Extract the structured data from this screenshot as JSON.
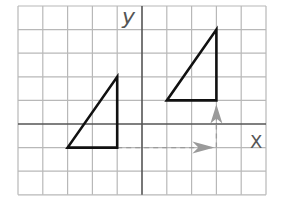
{
  "diagram": {
    "type": "coordinate-grid-translation",
    "grid": {
      "x_min": -5,
      "x_max": 5,
      "y_min": -3,
      "y_max": 5,
      "origin_px": [
        142,
        124
      ],
      "cell_w": 24.8,
      "cell_h": 23.6,
      "grid_color": "#b8b8b8",
      "axis_color": "#555555"
    },
    "axes": {
      "x_label": "X",
      "y_label": "y"
    },
    "shapes": [
      {
        "name": "original-triangle",
        "vertices": [
          [
            -3,
            -1
          ],
          [
            -1,
            -1
          ],
          [
            -1,
            2
          ]
        ],
        "stroke": "#111111"
      },
      {
        "name": "translated-triangle",
        "vertices": [
          [
            1,
            1
          ],
          [
            3,
            1
          ],
          [
            3,
            4
          ]
        ],
        "stroke": "#111111"
      }
    ],
    "translation_arrows": [
      {
        "name": "horizontal-arrow",
        "from": [
          -1,
          -1
        ],
        "to": [
          3,
          -1
        ],
        "direction": "right",
        "units": 4
      },
      {
        "name": "vertical-arrow",
        "from": [
          3,
          -1
        ],
        "to": [
          3,
          1
        ],
        "direction": "up",
        "units": 2
      }
    ],
    "arrow_color": "#9a9a9a"
  }
}
